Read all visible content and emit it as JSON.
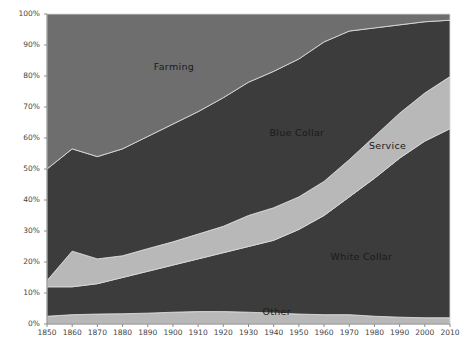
{
  "chart_data": {
    "type": "area",
    "stacked": true,
    "normalized_percent": true,
    "title": "",
    "subtitle": "",
    "xlabel": "",
    "ylabel": "",
    "xlim": [
      1850,
      2010
    ],
    "ylim": [
      0,
      100
    ],
    "grid": false,
    "legend_position": "inline-labels",
    "x": [
      1850,
      1860,
      1870,
      1880,
      1890,
      1900,
      1910,
      1920,
      1930,
      1940,
      1950,
      1960,
      1970,
      1980,
      1990,
      2000,
      2010
    ],
    "xtick_labels": [
      "1850",
      "1860",
      "1870",
      "1880",
      "1890",
      "1900",
      "1910",
      "1920",
      "1930",
      "1940",
      "1950",
      "1960",
      "1970",
      "1980",
      "1990",
      "2000",
      "2010"
    ],
    "ytick_labels": [
      "0%",
      "10%",
      "20%",
      "30%",
      "40%",
      "50%",
      "60%",
      "70%",
      "80%",
      "90%",
      "100%"
    ],
    "ytick_values": [
      0,
      10,
      20,
      30,
      40,
      50,
      60,
      70,
      80,
      90,
      100
    ],
    "stack_order_bottom_to_top": [
      "Other",
      "White Collar",
      "Service",
      "Blue Collar",
      "Farming"
    ],
    "series": [
      {
        "name": "Other",
        "color": "#b8b8b8",
        "label_text": "Other",
        "values": [
          2.5,
          3.0,
          3.2,
          3.3,
          3.5,
          3.8,
          4.0,
          4.0,
          3.8,
          3.5,
          3.2,
          3.0,
          3.0,
          2.5,
          2.2,
          2.0,
          2.0
        ]
      },
      {
        "name": "White Collar",
        "color": "#3c3c3c",
        "label_text": "White Collar",
        "values": [
          9.5,
          9.0,
          9.8,
          11.7,
          13.5,
          15.2,
          17.0,
          19.0,
          21.2,
          23.5,
          27.3,
          32.0,
          38.0,
          44.5,
          51.3,
          57.0,
          61.0
        ]
      },
      {
        "name": "Service",
        "color": "#b8b8b8",
        "label_text": "Service",
        "values": [
          2.0,
          11.5,
          8.0,
          7.0,
          7.3,
          7.5,
          8.0,
          8.5,
          10.0,
          10.5,
          10.5,
          11.0,
          12.0,
          13.5,
          14.5,
          15.5,
          16.8
        ]
      },
      {
        "name": "Blue Collar",
        "color": "#3c3c3c",
        "label_text": "Blue Collar",
        "values": [
          36.0,
          33.0,
          33.0,
          34.5,
          36.2,
          38.0,
          39.5,
          41.5,
          43.0,
          44.0,
          44.5,
          45.0,
          41.5,
          35.0,
          28.5,
          23.0,
          18.2
        ]
      },
      {
        "name": "Farming",
        "color": "#6e6e6e",
        "label_text": "Farming",
        "values": [
          50.0,
          43.5,
          46.0,
          43.5,
          39.5,
          35.5,
          31.5,
          27.0,
          22.0,
          18.5,
          14.5,
          9.0,
          5.5,
          4.5,
          3.5,
          2.5,
          2.0
        ]
      }
    ],
    "annotations": [
      {
        "text": "Farming",
        "x_pct": 31.5,
        "y_pct": 83.0
      },
      {
        "text": "Blue Collar",
        "x_pct": 62.0,
        "y_pct": 61.5
      },
      {
        "text": "Service",
        "x_pct": 84.5,
        "y_pct": 57.5
      },
      {
        "text": "White Collar",
        "x_pct": 78.0,
        "y_pct": 21.5
      },
      {
        "text": "Other",
        "x_pct": 57.0,
        "y_pct": 4.0
      }
    ],
    "colors": {
      "farming": "#6e6e6e",
      "blue_collar": "#3c3c3c",
      "service": "#b8b8b8",
      "white_collar": "#3c3c3c",
      "other": "#b8b8b8",
      "axis": "#8c8c8c",
      "tick_text": "#444444",
      "label_text": "#1a1a1a",
      "separator": "#d8d8d8",
      "background": "#ffffff"
    }
  }
}
